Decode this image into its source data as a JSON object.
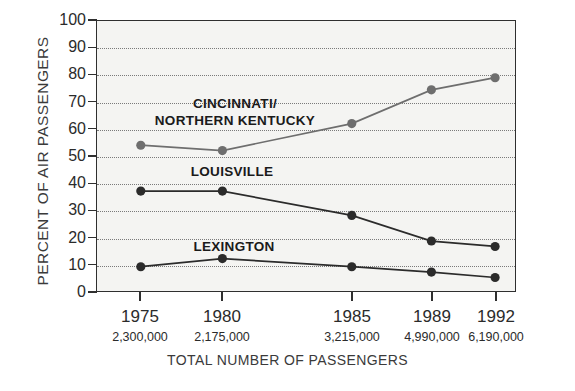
{
  "chart_data": {
    "type": "line",
    "title": "",
    "xlabel": "TOTAL NUMBER OF PASSENGERS",
    "ylabel": "PERCENT OF AIR PASSENGERS",
    "categories": [
      "1975",
      "1980",
      "1985",
      "1989",
      "1992"
    ],
    "x_sublabels": [
      "2,300,000",
      "2,175,000",
      "3,215,000",
      "4,990,000",
      "6,190,000"
    ],
    "ylim": [
      0,
      100
    ],
    "yticks": [
      0,
      10,
      20,
      30,
      40,
      50,
      60,
      70,
      80,
      90,
      100
    ],
    "grid": true,
    "legend_position": "inline-annotations",
    "series": [
      {
        "name": "CINCINNATI/\nNORTHERN KENTUCKY",
        "label_line1": "CINCINNATI/",
        "label_line2": "NORTHERN KENTUCKY",
        "color": "#6e6e6e",
        "values": [
          54,
          52,
          62,
          74.5,
          79
        ]
      },
      {
        "name": "LOUISVILLE",
        "label_line1": "LOUISVILLE",
        "label_line2": "",
        "color": "#2b2b2b",
        "values": [
          37,
          37,
          28,
          18.5,
          16.5
        ]
      },
      {
        "name": "LEXINGTON",
        "label_line1": "LEXINGTON",
        "label_line2": "",
        "color": "#2b2b2b",
        "values": [
          9,
          12,
          9,
          7,
          5
        ]
      }
    ]
  },
  "axis": {
    "y_labels": [
      "100",
      "90",
      "80",
      "70",
      "60",
      "50",
      "40",
      "30",
      "20",
      "10",
      "0"
    ],
    "y_title": "PERCENT OF AIR PASSENGERS",
    "x_title": "TOTAL NUMBER OF PASSENGERS"
  },
  "colors": {
    "plot_background": "#f4f4f2",
    "frame": "#2f2f2f",
    "grid": "#7a7a7a",
    "series_light": "#6e6e6e",
    "series_dark": "#2b2b2b",
    "page_background": "#ffffff"
  }
}
